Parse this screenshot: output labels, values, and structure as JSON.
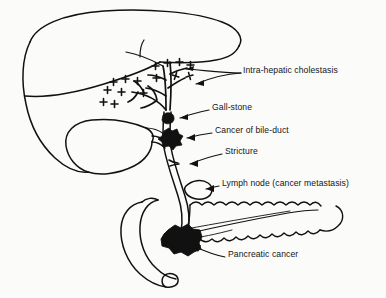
{
  "figure": {
    "kind": "anatomical-line-drawing",
    "background_color": "#fbfbf9",
    "ink_color": "#111111",
    "labels": [
      {
        "id": "intra-hepatic-cholestasis",
        "text": "Intra-hepatic cholestasis",
        "x": 243,
        "y": 70
      },
      {
        "id": "gall-stone",
        "text": "Gall-stone",
        "x": 212,
        "y": 107
      },
      {
        "id": "cancer-of-bile-duct",
        "text": "Cancer of bile-duct",
        "x": 215,
        "y": 130
      },
      {
        "id": "stricture",
        "text": "Stricture",
        "x": 225,
        "y": 151
      },
      {
        "id": "lymph-node-cancer-metastasis",
        "text": "Lymph node (cancer metastasis)",
        "x": 222,
        "y": 183
      },
      {
        "id": "pancreatic-cancer",
        "text": "Pancreatic cancer",
        "x": 228,
        "y": 254
      }
    ],
    "structures": [
      {
        "id": "liver",
        "name": "liver"
      },
      {
        "id": "gallbladder",
        "name": "gallbladder"
      },
      {
        "id": "intrahepatic-bile-ducts",
        "name": "intra-hepatic bile duct tree"
      },
      {
        "id": "cholestasis-marks",
        "name": "cholestasis plus marks",
        "glyph": "+",
        "count": 15
      },
      {
        "id": "common-bile-duct",
        "name": "common bile duct"
      },
      {
        "id": "gallstone-mass",
        "name": "gall-stone"
      },
      {
        "id": "bile-duct-cancer-mass",
        "name": "cancer of bile-duct mass"
      },
      {
        "id": "stricture-point",
        "name": "stricture"
      },
      {
        "id": "lymph-node",
        "name": "metastatic lymph node"
      },
      {
        "id": "duodenum",
        "name": "duodenum"
      },
      {
        "id": "pancreas",
        "name": "pancreas"
      },
      {
        "id": "pancreatic-duct",
        "name": "pancreatic duct"
      },
      {
        "id": "pancreatic-cancer-mass",
        "name": "pancreatic cancer mass"
      }
    ]
  }
}
